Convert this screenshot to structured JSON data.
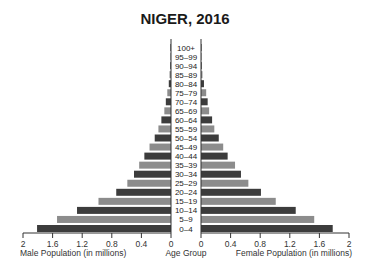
{
  "title": "NIGER, 2016",
  "chart_data": {
    "type": "bar",
    "subtype": "population-pyramid",
    "title": "NIGER, 2016",
    "categories": [
      "100+",
      "95–99",
      "90–94",
      "85–89",
      "80–84",
      "75–79",
      "70–74",
      "65–69",
      "60–64",
      "55–59",
      "50–54",
      "45–49",
      "40–44",
      "35–39",
      "30–34",
      "25–29",
      "20–24",
      "15–19",
      "10–14",
      "5–9",
      "0–4"
    ],
    "series": [
      {
        "name": "Male Population (in millions)",
        "side": "left",
        "values": [
          0.003,
          0.006,
          0.01,
          0.02,
          0.03,
          0.05,
          0.07,
          0.09,
          0.13,
          0.17,
          0.22,
          0.29,
          0.36,
          0.43,
          0.5,
          0.59,
          0.74,
          0.98,
          1.27,
          1.54,
          1.81
        ]
      },
      {
        "name": "Female Population (in millions)",
        "side": "right",
        "values": [
          0.003,
          0.006,
          0.01,
          0.02,
          0.04,
          0.07,
          0.09,
          0.11,
          0.15,
          0.18,
          0.24,
          0.3,
          0.36,
          0.46,
          0.54,
          0.64,
          0.81,
          1.01,
          1.28,
          1.53,
          1.78
        ]
      }
    ],
    "xlabel_left": "Male Population (in millions)",
    "xlabel_center": "Age Group",
    "xlabel_right": "Female Population (in millions)",
    "left_ticks": [
      "2",
      "1.6",
      "1.2",
      "0.8",
      "0.4",
      "0"
    ],
    "right_ticks": [
      "0",
      "0.4",
      "0.8",
      "1.2",
      "1.6",
      "2"
    ],
    "xlim": [
      0,
      2
    ],
    "colors": {
      "dark": "#3c3c3c",
      "light": "#8c8c8c"
    },
    "grid": false,
    "legend": "none"
  }
}
